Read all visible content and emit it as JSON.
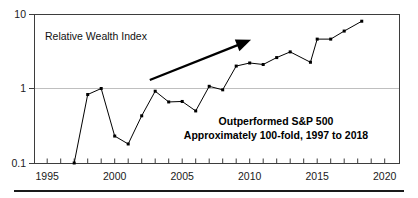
{
  "figure": {
    "inner_label": "Relative Wealth Index",
    "annotation": {
      "line1": "Outperformed S&P 500",
      "line2": "Approximately 100-fold, 1997 to 2018"
    },
    "colors": {
      "series": "#000000",
      "axis": "#3d3d3d",
      "grid": "#bfbfbf",
      "background": "#ffffff",
      "annotation_text": "#000000"
    }
  },
  "chart_data": {
    "type": "line",
    "title": "",
    "subtitle": "",
    "xlabel": "",
    "ylabel": "Relative Wealth Index",
    "yscale": "log",
    "xscale": "linear",
    "xlim": [
      1994,
      2021
    ],
    "ylim": [
      0.1,
      10
    ],
    "grid": true,
    "grid_lines_y": [
      1
    ],
    "legend": false,
    "legend_position": "none",
    "ytick_labels": [
      "10",
      "1",
      "0.1"
    ],
    "ytick_values": [
      10,
      1,
      0.1
    ],
    "xtick_labels": [
      "1995",
      "2000",
      "2005",
      "2010",
      "2015",
      "2020"
    ],
    "xtick_values": [
      1995,
      2000,
      2005,
      2010,
      2015,
      2020
    ],
    "xtick_minor_step": 1,
    "series": [
      {
        "name": "Relative Wealth Index",
        "x": [
          1997,
          1998,
          1999,
          2000,
          2001,
          2002,
          2003,
          2004,
          2005,
          2006,
          2007,
          2008,
          2009,
          2010,
          2011,
          2012,
          2013,
          2014.5,
          2015,
          2016,
          2017,
          2018.3
        ],
        "values": [
          0.1,
          0.83,
          1.0,
          0.23,
          0.18,
          0.43,
          0.92,
          0.66,
          0.67,
          0.5,
          1.07,
          0.96,
          2.0,
          2.2,
          2.1,
          2.6,
          3.1,
          2.25,
          4.6,
          4.6,
          5.9,
          8.0
        ]
      }
    ],
    "annotations": [
      {
        "kind": "arrow",
        "x_start": 2002.6,
        "y_start": 1.3,
        "x_end": 2010.1,
        "y_end": 4.5
      },
      {
        "kind": "text",
        "text": "Outperformed S&P 500",
        "x": 2011.5,
        "y": 0.36
      },
      {
        "kind": "text",
        "text": "Approximately 100-fold, 1997 to 2018",
        "x": 2011.5,
        "y": 0.28
      },
      {
        "kind": "text",
        "text": "Relative Wealth Index",
        "x": 1995.6,
        "y": 5.6
      }
    ]
  }
}
